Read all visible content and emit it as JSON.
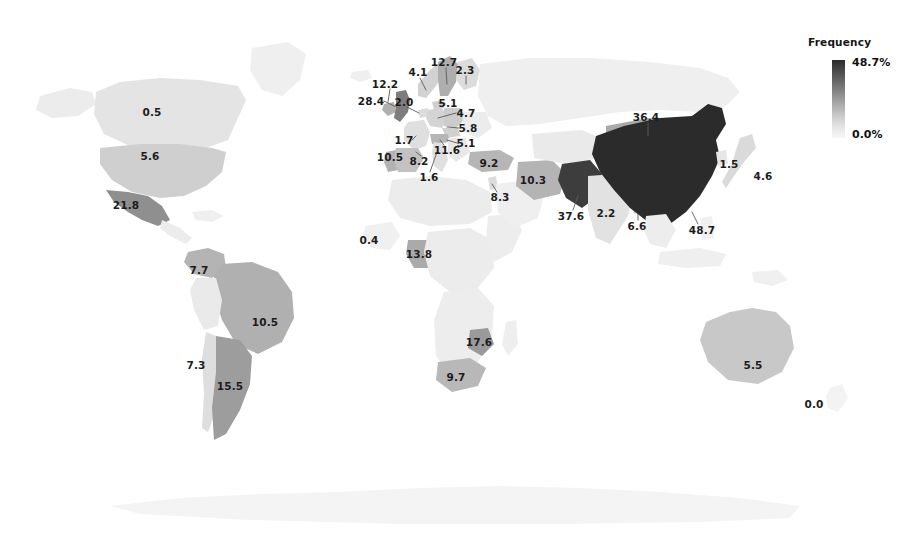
{
  "figure": {
    "type": "choropleth-world-map",
    "background": "#ffffff"
  },
  "legend": {
    "title": "Frequency",
    "max_label": "48.7%",
    "min_label": "0.0%",
    "max_value": 48.7,
    "min_value": 0.0,
    "orientation": "vertical",
    "color_high": "#2b2b2b",
    "color_low": "#f7f7f7"
  },
  "chart_data": {
    "type": "heatmap",
    "title": "Frequency",
    "xlabel": "",
    "ylabel": "",
    "legend_position": "top-right",
    "value_unit": "%",
    "value_range": [
      0.0,
      48.7
    ],
    "color_scale": [
      "#f7f7f7",
      "#cfcfcf",
      "#a8a8a8",
      "#7b7b7b",
      "#4a4a4a",
      "#2b2b2b"
    ],
    "categories": [
      "Canada",
      "United States",
      "Mexico",
      "Colombia",
      "Brazil",
      "Chile",
      "Argentina",
      "United Kingdom",
      "Ireland",
      "Netherlands",
      "Norway",
      "Sweden",
      "Finland",
      "Denmark",
      "Germany",
      "Poland",
      "Czechia",
      "France",
      "Portugal",
      "Spain",
      "Italy",
      "Turkey",
      "Israel",
      "Iran",
      "Mali",
      "Nigeria",
      "Mozambique",
      "South Africa",
      "Mongolia",
      "Pakistan",
      "India",
      "Bangladesh",
      "China",
      "South Korea",
      "Japan",
      "Australia",
      "New Zealand"
    ],
    "values": [
      0.5,
      5.6,
      21.8,
      7.7,
      10.5,
      7.3,
      15.5,
      28.4,
      12.2,
      2.0,
      4.1,
      12.7,
      2.3,
      5.1,
      4.7,
      5.8,
      5.1,
      1.7,
      10.5,
      8.2,
      1.6,
      9.2,
      8.3,
      10.3,
      0.4,
      13.8,
      17.6,
      9.7,
      36.4,
      37.6,
      2.2,
      6.6,
      48.7,
      1.5,
      4.6,
      5.5,
      0.0
    ]
  },
  "labels": [
    {
      "name": "canada",
      "text": "0.5",
      "x": 152,
      "y": 112
    },
    {
      "name": "united-states",
      "text": "5.6",
      "x": 150,
      "y": 156
    },
    {
      "name": "mexico",
      "text": "21.8",
      "x": 126,
      "y": 205
    },
    {
      "name": "colombia",
      "text": "7.7",
      "x": 199,
      "y": 270
    },
    {
      "name": "brazil",
      "text": "10.5",
      "x": 265,
      "y": 322
    },
    {
      "name": "chile",
      "text": "7.3",
      "x": 196,
      "y": 365
    },
    {
      "name": "argentina",
      "text": "15.5",
      "x": 230,
      "y": 386
    },
    {
      "name": "united-kingdom",
      "text": "28.4",
      "x": 371,
      "y": 101
    },
    {
      "name": "ireland",
      "text": "12.2",
      "x": 385,
      "y": 84
    },
    {
      "name": "netherlands",
      "text": "2.0",
      "x": 404,
      "y": 102
    },
    {
      "name": "norway",
      "text": "4.1",
      "x": 418,
      "y": 72
    },
    {
      "name": "sweden",
      "text": "12.7",
      "x": 444,
      "y": 62
    },
    {
      "name": "finland",
      "text": "2.3",
      "x": 465,
      "y": 70
    },
    {
      "name": "denmark",
      "text": "5.1",
      "x": 448,
      "y": 103
    },
    {
      "name": "germany",
      "text": "4.7",
      "x": 466,
      "y": 113
    },
    {
      "name": "poland",
      "text": "5.8",
      "x": 468,
      "y": 128
    },
    {
      "name": "czechia",
      "text": "5.1",
      "x": 466,
      "y": 143
    },
    {
      "name": "france",
      "text": "1.7",
      "x": 404,
      "y": 140
    },
    {
      "name": "portugal",
      "text": "10.5",
      "x": 390,
      "y": 157
    },
    {
      "name": "spain",
      "text": "8.2",
      "x": 419,
      "y": 161
    },
    {
      "name": "austria",
      "text": "11.6",
      "x": 447,
      "y": 150
    },
    {
      "name": "italy",
      "text": "1.6",
      "x": 429,
      "y": 177
    },
    {
      "name": "turkey",
      "text": "9.2",
      "x": 489,
      "y": 163
    },
    {
      "name": "israel",
      "text": "8.3",
      "x": 500,
      "y": 197
    },
    {
      "name": "iran",
      "text": "10.3",
      "x": 533,
      "y": 180
    },
    {
      "name": "mali",
      "text": "0.4",
      "x": 369,
      "y": 240
    },
    {
      "name": "nigeria",
      "text": "13.8",
      "x": 419,
      "y": 254
    },
    {
      "name": "mozambique",
      "text": "17.6",
      "x": 479,
      "y": 342
    },
    {
      "name": "south-africa",
      "text": "9.7",
      "x": 456,
      "y": 377
    },
    {
      "name": "mongolia",
      "text": "36.4",
      "x": 646,
      "y": 117
    },
    {
      "name": "pakistan",
      "text": "37.6",
      "x": 571,
      "y": 216
    },
    {
      "name": "india",
      "text": "2.2",
      "x": 606,
      "y": 213
    },
    {
      "name": "bangladesh",
      "text": "6.6",
      "x": 637,
      "y": 226
    },
    {
      "name": "china",
      "text": "48.7",
      "x": 702,
      "y": 230
    },
    {
      "name": "south-korea",
      "text": "1.5",
      "x": 729,
      "y": 164
    },
    {
      "name": "japan",
      "text": "4.6",
      "x": 763,
      "y": 176
    },
    {
      "name": "australia",
      "text": "5.5",
      "x": 753,
      "y": 365
    },
    {
      "name": "new-zealand",
      "text": "0.0",
      "x": 814,
      "y": 404
    }
  ]
}
